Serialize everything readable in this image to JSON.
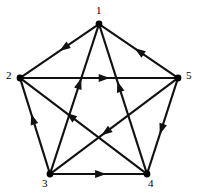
{
  "figure": {
    "type": "directed-graph",
    "width": 198,
    "height": 194,
    "background_color": "#ffffff",
    "line_color": "#111111",
    "vertex_color": "#000000",
    "label_color": "#000000"
  },
  "vertices": [
    {
      "id": "1",
      "label": "1",
      "x": 99,
      "y": 24,
      "label_x": 96,
      "label_y": 5,
      "label_position": "top"
    },
    {
      "id": "2",
      "label": "2",
      "x": 20,
      "y": 78,
      "label_x": 6,
      "label_y": 70,
      "label_position": "left"
    },
    {
      "id": "3",
      "label": "3",
      "x": 50,
      "y": 174,
      "label_x": 42,
      "label_y": 178,
      "label_position": "bottom-left"
    },
    {
      "id": "4",
      "label": "4",
      "x": 147,
      "y": 174,
      "label_x": 148,
      "label_y": 178,
      "label_position": "bottom-right"
    },
    {
      "id": "5",
      "label": "5",
      "x": 178,
      "y": 78,
      "label_x": 186,
      "label_y": 70,
      "label_position": "right"
    }
  ],
  "edges": [
    {
      "id": "e-1-2",
      "from": "1",
      "to": "2",
      "label": "1 to 2",
      "kind": "outer",
      "arrow_t": 0.47
    },
    {
      "id": "e-5-1",
      "from": "5",
      "to": "1",
      "label": "5 to 1",
      "kind": "outer",
      "arrow_t": 0.52
    },
    {
      "id": "e-2-5",
      "from": "2",
      "to": "5",
      "label": "2 to 5",
      "kind": "chord",
      "arrow_t": 0.55
    },
    {
      "id": "e-3-2",
      "from": "3",
      "to": "2",
      "label": "3 to 2",
      "kind": "outer",
      "arrow_t": 0.6
    },
    {
      "id": "e-5-4",
      "from": "5",
      "to": "4",
      "label": "5 to 4",
      "kind": "outer",
      "arrow_t": 0.56
    },
    {
      "id": "e-3-4",
      "from": "3",
      "to": "4",
      "label": "3 to 4",
      "kind": "chord",
      "arrow_t": 0.55
    },
    {
      "id": "e-3-1",
      "from": "3",
      "to": "1",
      "label": "3 to 1",
      "kind": "chord",
      "arrow_t": 0.62
    },
    {
      "id": "e-4-1",
      "from": "4",
      "to": "1",
      "label": "4 to 1",
      "kind": "chord",
      "arrow_t": 0.6
    },
    {
      "id": "e-4-2",
      "from": "4",
      "to": "2",
      "label": "4 to 2",
      "kind": "chord",
      "arrow_t": 0.62
    },
    {
      "id": "e-5-3",
      "from": "5",
      "to": "3",
      "label": "5 to 3",
      "kind": "chord",
      "arrow_t": 0.58
    }
  ],
  "geometry": {
    "vertex_radius": 3.4,
    "edge_width": 2.1,
    "arrow_length": 11,
    "arrow_half_width": 3.9
  }
}
